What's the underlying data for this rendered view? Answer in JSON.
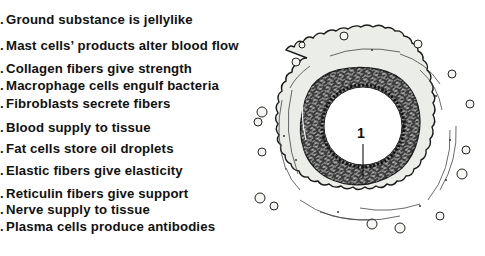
{
  "figure": {
    "labels": [
      {
        "prefix": ".",
        "text": "Ground substance is jellylike",
        "y": 12
      },
      {
        "prefix": ".",
        "text": "Mast cells’ products alter blood flow",
        "y": 38
      },
      {
        "prefix": ".",
        "text": "Collagen fibers give strength",
        "y": 61
      },
      {
        "prefix": ".",
        "text": "Macrophage cells engulf bacteria",
        "y": 78
      },
      {
        "prefix": ".",
        "text": "Fibroblasts secrete fibers",
        "y": 96
      },
      {
        "prefix": ".",
        "text": "Blood supply to tissue",
        "y": 120
      },
      {
        "prefix": ".",
        "text": "Fat cells store oil droplets",
        "y": 141
      },
      {
        "prefix": ".",
        "text": "Elastic fibers give elasticity",
        "y": 163
      },
      {
        "prefix": ".",
        "text": "Reticulin fibers give support",
        "y": 186
      },
      {
        "prefix": ".",
        "text": "Nerve supply to tissue",
        "y": 202
      },
      {
        "prefix": ".",
        "text": "Plasma cells produce antibodies",
        "y": 219
      }
    ],
    "callout": {
      "number": "1"
    },
    "colors": {
      "ink": "#111111",
      "adventitia_fill": "#e9ece7",
      "muscle_dark": "#2b2b2b",
      "lumen": "#ffffff"
    }
  }
}
